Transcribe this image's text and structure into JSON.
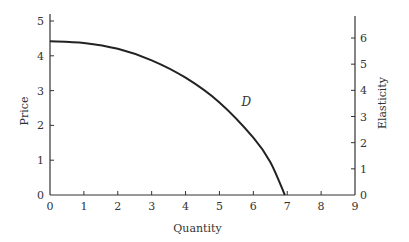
{
  "chart_data": {
    "type": "line",
    "title": "",
    "xlabel": "Quantity",
    "ylabel": "Price",
    "y2label": "Elasticity",
    "xlim": [
      0,
      9
    ],
    "ylim": [
      0,
      5
    ],
    "y2lim": [
      0,
      6
    ],
    "x_ticks": [
      "0",
      "1",
      "2",
      "3",
      "4",
      "5",
      "6",
      "7",
      "8",
      "9"
    ],
    "y_ticks": [
      "0",
      "1",
      "2",
      "3",
      "4",
      "5"
    ],
    "y2_ticks": [
      "0",
      "1",
      "2",
      "3",
      "4",
      "5",
      "6"
    ],
    "grid": false,
    "series": [
      {
        "name": "D",
        "label": "D",
        "x": [
          0,
          1,
          2,
          3,
          4,
          5,
          6,
          6.5,
          6.93
        ],
        "y": [
          4.42,
          4.37,
          4.2,
          3.87,
          3.37,
          2.66,
          1.65,
          0.95,
          0
        ]
      }
    ]
  }
}
